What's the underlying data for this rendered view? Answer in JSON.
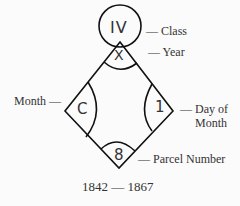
{
  "diagram": {
    "type": "hallmark-style date mark",
    "center_symbols": {
      "class": "IV",
      "year": "X",
      "month": "C",
      "day": "1",
      "parcel": "8"
    },
    "labels": {
      "class": "— Class",
      "year": "— Year",
      "month": "Month —",
      "day_line1": "— Day of",
      "day_line2": "Month",
      "parcel": "— Parcel Number"
    },
    "caption": "1842 — 1867"
  }
}
